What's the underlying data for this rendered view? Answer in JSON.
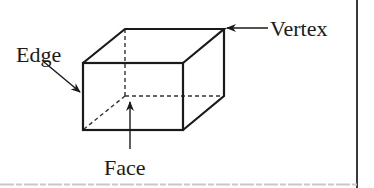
{
  "diagram": {
    "type": "labeled-3d-figure",
    "labels": {
      "edge": "Edge",
      "vertex": "Vertex",
      "face": "Face"
    },
    "colors": {
      "line": "#1a1a1a",
      "border": "#3a3a3a",
      "bottom_border": "#c8c8c8",
      "background": "#ffffff"
    }
  }
}
